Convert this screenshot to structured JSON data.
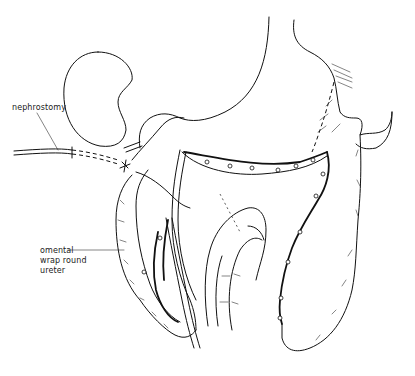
{
  "figure": {
    "type": "surgical line illustration",
    "labels": {
      "nephrostomy": "nephrostomy",
      "omental_line1": "omental",
      "omental_line2": "wrap round",
      "omental_line3": "ureter"
    }
  },
  "colors": {
    "line": "#111111",
    "background": "#ffffff"
  }
}
